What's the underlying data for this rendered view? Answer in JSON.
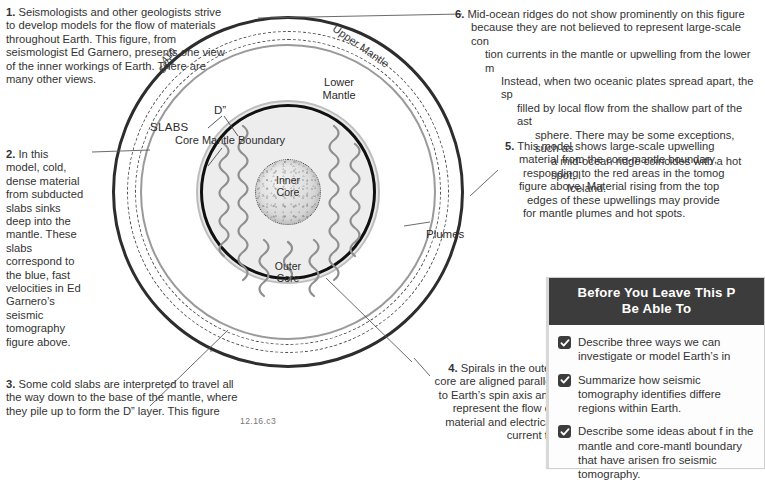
{
  "page": {
    "figure_caption": "12.16.c3"
  },
  "figure": {
    "labels": {
      "upper_mantle": "Upper Mantle",
      "depth_410": "410",
      "depth_660": "660",
      "lower_mantle": "Lower\nMantle",
      "lower_mantle_l1": "Lower",
      "lower_mantle_l2": "Mantle",
      "d_double_prime": "D”",
      "core_mantle_boundary": "Core Mantle Boundary",
      "inner_core_l1": "Inner",
      "inner_core_l2": "Core",
      "outer_core_l1": "Outer",
      "outer_core_l2": "Core",
      "slabs": "SLABS",
      "plumes": "Plumes"
    }
  },
  "notes": {
    "n1": {
      "number": "1.",
      "text": "Seismologists and other geologists strive to develop models for the flow of materials throughout Earth. This figure, from seismologist Ed Garnero, presents one view of the inner workings of Earth. There are many other views."
    },
    "n2": {
      "number": "2.",
      "text": "In this model, cold, dense material from subducted slabs sinks deep into the mantle. These slabs correspond to the blue, fast velocities in Ed Garnero’s seismic tomography figure above."
    },
    "n3": {
      "number": "3.",
      "text": "Some cold slabs are interpreted to travel all the way down to the base of the mantle, where they pile up to form the D” layer. This figure"
    },
    "n4": {
      "number": "4.",
      "text": "Spirals in the outer core are aligned parallel to Earth’s spin axis and represent the flow of material and electrical current to"
    },
    "n5": {
      "number": "5.",
      "lines": [
        "This model shows large-scale upwelling",
        "material from the core-mantle boundary,",
        "responding to the red areas in the tomog",
        "figure above. Material rising from the top",
        "edges of these upwellings may provide",
        "for mantle plumes and hot spots."
      ]
    },
    "n6": {
      "number": "6.",
      "lines": [
        "Mid-ocean ridges do not show prominently on this figure",
        "because they are not believed to represent large-scale con",
        "tion currents in the mantle or upwelling from the lower m",
        "Instead, when two oceanic plates spread apart, the sp",
        "filled by local flow from the shallow part of the ast",
        "sphere. There may be some exceptions, such as",
        "a mid-ocean ridge coincides with a hot spot, l",
        "Iceland."
      ]
    }
  },
  "objectives_box": {
    "header_line1": "Before You Leave This P",
    "header_line2": "Be Able To",
    "items": [
      "Describe three ways we can investigate or model Earth’s in",
      "Summarize how seismic tomography identifies differe regions within Earth.",
      "Describe some ideas about f in the mantle and core-mantl boundary that have arisen fro seismic tomography."
    ]
  },
  "colors": {
    "header_bg": "#3c3c3c",
    "text": "#333333",
    "cmb_stroke": "#111111",
    "arrow": "#9a9a9a"
  }
}
